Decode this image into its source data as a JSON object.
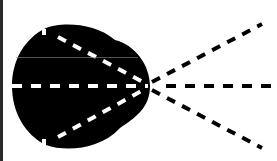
{
  "diagram": {
    "colors": {
      "background": "#ffffff",
      "blob": "#000000",
      "dash_inside": "#ffffff",
      "dash_outside": "#000000",
      "left_border": "#2a2a2a"
    },
    "convergence_point": [
      148,
      86
    ],
    "rays": [
      {
        "name": "upper",
        "from": [
          45,
          30
        ],
        "to": [
          260,
          24
        ]
      },
      {
        "name": "middle",
        "from": [
          12,
          86
        ],
        "to": [
          272,
          86
        ]
      },
      {
        "name": "lower",
        "from": [
          45,
          145
        ],
        "to": [
          260,
          148
        ]
      }
    ]
  }
}
